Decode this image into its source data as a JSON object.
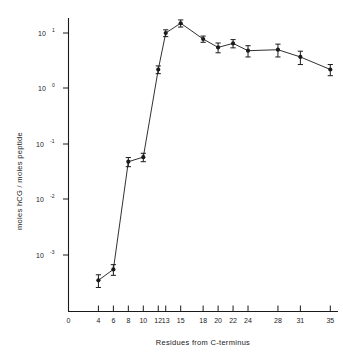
{
  "chart_data": {
    "type": "line",
    "title": "",
    "xlabel": "Residues  from  C-terminus",
    "ylabel": "moles hCG / moles  peptide",
    "yscale": "log",
    "ylim": [
      0.0002,
      30
    ],
    "xlim": [
      0,
      37
    ],
    "grid": false,
    "legend": null,
    "xticks": [
      0,
      4,
      6,
      8,
      10,
      12,
      13,
      15,
      18,
      20,
      22,
      24,
      28,
      31,
      35
    ],
    "xticklabels": [
      "0",
      "4",
      "6",
      "8",
      "10",
      "12",
      "13",
      "15",
      "18",
      "20",
      "22",
      "24",
      "28",
      "31",
      "35"
    ],
    "yticks": [
      10,
      1,
      0.1,
      0.01,
      0.001
    ],
    "yticklabels": [
      "10 1",
      "10 0",
      "10 -1",
      "10 -2",
      "10 -3"
    ],
    "ytick_mantissa": [
      "10",
      "10",
      "10",
      "10",
      "10"
    ],
    "ytick_exponents": [
      "1",
      "0",
      "-1",
      "-2",
      "-3"
    ],
    "x": [
      4,
      6,
      8,
      10,
      12,
      13,
      15,
      18,
      20,
      22,
      24,
      28,
      31,
      35
    ],
    "values": [
      0.00035,
      0.00055,
      0.048,
      0.058,
      2.2,
      10.0,
      15.0,
      7.8,
      5.5,
      6.5,
      4.8,
      5.0,
      3.7,
      2.2
    ],
    "yerr_low": [
      9e-05,
      0.00012,
      0.009,
      0.01,
      0.35,
      1.4,
      2.2,
      1.0,
      1.1,
      1.1,
      1.1,
      1.3,
      1.0,
      0.5
    ],
    "yerr_high": [
      9e-05,
      0.00012,
      0.009,
      0.01,
      0.35,
      1.4,
      2.2,
      1.0,
      1.1,
      1.1,
      1.1,
      1.3,
      1.0,
      0.5
    ],
    "marker": "filled-circle",
    "line_color": "#1a1a1a",
    "marker_color": "#1a1a1a"
  },
  "axes": {
    "x_axis_label": "Residues  from  C-terminus",
    "y_axis_label": "moles hCG / moles  peptide"
  }
}
